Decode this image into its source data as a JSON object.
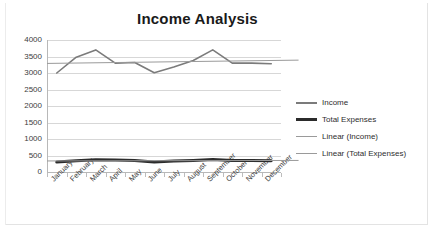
{
  "chart_data": {
    "type": "line",
    "title": "Income Analysis",
    "xlabel": "",
    "ylabel": "",
    "ylim": [
      0,
      4000
    ],
    "ytick_step": 500,
    "ytick_labels": [
      "4000",
      "3500",
      "3000",
      "2500",
      "2000",
      "1500",
      "1000",
      "500",
      "0"
    ],
    "grid": true,
    "legend_position": "right",
    "categories": [
      "January",
      "February",
      "March",
      "April",
      "May",
      "June",
      "July",
      "August",
      "September",
      "October",
      "November",
      "December"
    ],
    "series": [
      {
        "name": "Income",
        "type": "line",
        "color": "#7b7b7b",
        "width": 1.6,
        "values": [
          3000,
          3480,
          3700,
          3300,
          3320,
          3010,
          3180,
          3380,
          3700,
          3300,
          3300,
          3280
        ]
      },
      {
        "name": "Total Expenses",
        "type": "line",
        "color": "#2b2b2b",
        "width": 3.0,
        "values": [
          300,
          340,
          370,
          360,
          345,
          300,
          330,
          350,
          380,
          350,
          345,
          340
        ]
      },
      {
        "name": "Linear (Income)",
        "type": "trendline",
        "color": "#9a9a9a",
        "width": 1.0,
        "start_value": 3290,
        "end_value": 3390
      },
      {
        "name": "Linear (Total Expenses)",
        "type": "trendline",
        "color": "#9a9a9a",
        "width": 1.0,
        "start_value": 335,
        "end_value": 350
      }
    ],
    "legend": [
      "Income",
      "Total Expenses",
      "Linear (Income)",
      "Linear (Total Expenses)"
    ]
  }
}
